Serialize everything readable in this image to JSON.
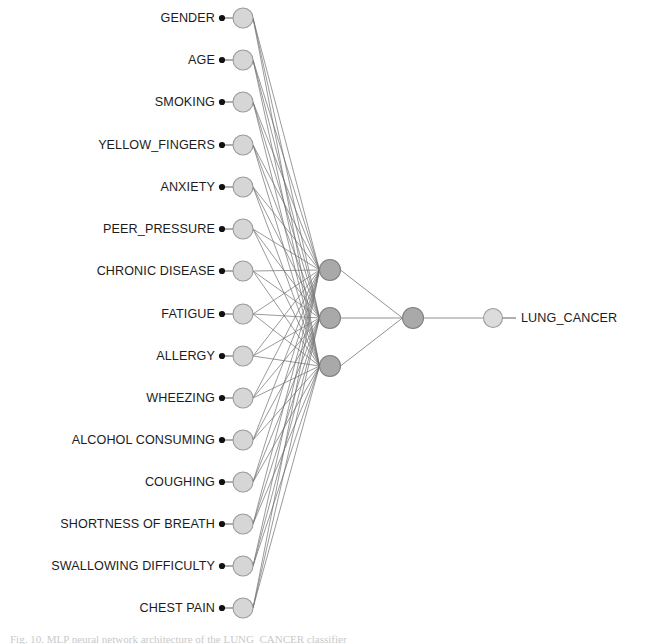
{
  "figure": {
    "caption": "Fig. 10. MLP neural network architecture of the LUNG_CANCER classifier"
  },
  "colors": {
    "background": "#ffffff",
    "input_node_fill": "#d6d6d6",
    "input_node_stroke": "#9a9a9a",
    "hidden_node_fill": "#a9a9a9",
    "hidden_node_stroke": "#808080",
    "aggregation_node_fill": "#a9a9a9",
    "output_node_fill": "#dcdcdc",
    "output_node_stroke": "#9a9a9a",
    "edge": "#6e6e6e",
    "marker_dot": "#111111",
    "label_text": "#1c1c1c"
  },
  "chart_data": {
    "type": "diagram",
    "subtype": "neural-network-graph",
    "title": "",
    "layers": [
      {
        "name": "input",
        "node_count": 15,
        "x": 243
      },
      {
        "name": "hidden",
        "node_count": 3,
        "x": 330
      },
      {
        "name": "aggregation",
        "node_count": 1,
        "x": 413
      },
      {
        "name": "output",
        "node_count": 1,
        "x": 493
      }
    ],
    "node_radius": {
      "input": 10,
      "hidden": 10.5,
      "aggregation": 10.5,
      "output": 9.5
    }
  },
  "input_layer": {
    "name": "input-layer",
    "nodes": [
      {
        "label": "GENDER",
        "y": 18
      },
      {
        "label": "AGE",
        "y": 60
      },
      {
        "label": "SMOKING",
        "y": 102
      },
      {
        "label": "YELLOW_FINGERS",
        "y": 145
      },
      {
        "label": "ANXIETY",
        "y": 187
      },
      {
        "label": "PEER_PRESSURE",
        "y": 229
      },
      {
        "label": "CHRONIC DISEASE",
        "y": 271
      },
      {
        "label": "FATIGUE",
        "y": 314
      },
      {
        "label": "ALLERGY",
        "y": 356
      },
      {
        "label": "WHEEZING",
        "y": 398
      },
      {
        "label": "ALCOHOL CONSUMING",
        "y": 440
      },
      {
        "label": "COUGHING",
        "y": 482
      },
      {
        "label": "SHORTNESS OF BREATH",
        "y": 524
      },
      {
        "label": "SWALLOWING DIFFICULTY",
        "y": 566
      },
      {
        "label": "CHEST PAIN",
        "y": 608
      }
    ]
  },
  "hidden_layer": {
    "name": "hidden-layer",
    "nodes": [
      {
        "y": 270
      },
      {
        "y": 318
      },
      {
        "y": 366
      }
    ]
  },
  "aggregation_layer": {
    "name": "aggregation-layer",
    "nodes": [
      {
        "y": 318
      }
    ]
  },
  "output_layer": {
    "name": "output-layer",
    "nodes": [
      {
        "label": "LUNG_CANCER",
        "y": 318
      }
    ]
  }
}
